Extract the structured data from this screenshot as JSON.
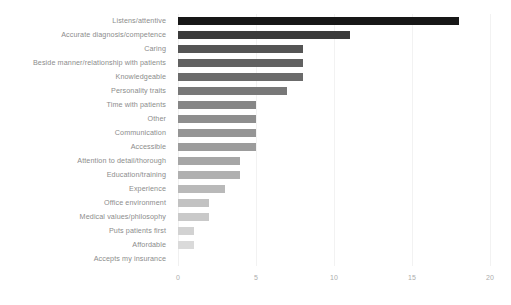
{
  "chart_data": {
    "type": "bar",
    "orientation": "horizontal",
    "title": "",
    "subtitle": "",
    "xlabel": "",
    "ylabel": "",
    "xlim": [
      0,
      20
    ],
    "xticks": [
      0,
      5,
      10,
      15,
      20
    ],
    "xtick_labels": [
      "0",
      "5",
      "10",
      "15",
      "20"
    ],
    "grid": true,
    "grid_axis": "x",
    "legend": false,
    "legend_position": "none",
    "categories": [
      "Listens/attentive",
      "Accurate diagnosis/competence",
      "Caring",
      "Beside manner/relationship with patients",
      "Knowledgeable",
      "Personality traits",
      "Time with patients",
      "Other",
      "Communication",
      "Accessible",
      "Attention to detail/thorough",
      "Education/training",
      "Experience",
      "Office environment",
      "Medical values/philosophy",
      "Puts patients first",
      "Affordable",
      "Accepts my insurance"
    ],
    "values": [
      18,
      11,
      8,
      8,
      8,
      7,
      5,
      5,
      5,
      5,
      4,
      4,
      3,
      2,
      2,
      1,
      1,
      0
    ],
    "bar_colors": [
      "#171717",
      "#3b3b3b",
      "#555555",
      "#616161",
      "#6b6b6b",
      "#787878",
      "#868686",
      "#8e8e8e",
      "#959595",
      "#9c9c9c",
      "#a6a6a6",
      "#b0b0b0",
      "#b9b9b9",
      "#c2c2c2",
      "#c9c9c9",
      "#d2d2d2",
      "#dadada",
      "#e2e2e2"
    ]
  },
  "axis": {
    "tick_color": "#adadad",
    "label_color": "#8c8c8c",
    "grid_color": "#f2f2f2"
  }
}
